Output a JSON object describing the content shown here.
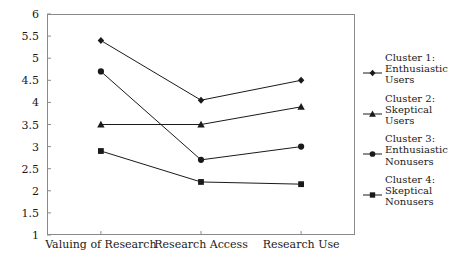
{
  "chart_data": {
    "type": "line",
    "title": "",
    "subtitle": "",
    "xlabel": "",
    "ylabel": "",
    "categories": [
      "Valuing of Research",
      "Research Access",
      "Research Use"
    ],
    "ylim": [
      1,
      6
    ],
    "yticks": [
      "1",
      "1.5",
      "2",
      "2.5",
      "3",
      "3.5",
      "4",
      "4.5",
      "5",
      "5.5",
      "6"
    ],
    "ytick_values": [
      1,
      1.5,
      2,
      2.5,
      3,
      3.5,
      4,
      4.5,
      5,
      5.5,
      6
    ],
    "grid": false,
    "legend_position": "right",
    "frame": "box",
    "series": [
      {
        "name": "Cluster 1:\nEnthusiastic Users",
        "legend_line1": "Cluster 1:",
        "legend_line2": "Enthusiastic",
        "legend_line3": "Users",
        "marker": "diamond",
        "color": "#1a1a1a",
        "values": [
          5.4,
          4.05,
          4.5
        ]
      },
      {
        "name": "Cluster 2:\nSkeptical Users",
        "legend_line1": "Cluster 2:",
        "legend_line2": "Skeptical",
        "legend_line3": "Users",
        "marker": "triangle",
        "color": "#1a1a1a",
        "values": [
          3.5,
          3.5,
          3.9
        ]
      },
      {
        "name": "Cluster 3:\nEnthusiastic Nonusers",
        "legend_line1": "Cluster 3:",
        "legend_line2": "Enthusiastic",
        "legend_line3": "Nonusers",
        "marker": "circle",
        "color": "#1a1a1a",
        "values": [
          4.7,
          2.7,
          3.0
        ]
      },
      {
        "name": "Cluster 4:\nSkeptical Nonusers",
        "legend_line1": "Cluster 4:",
        "legend_line2": "Skeptical",
        "legend_line3": "Nonusers",
        "marker": "square",
        "color": "#1a1a1a",
        "values": [
          2.9,
          2.2,
          2.15
        ]
      }
    ]
  }
}
